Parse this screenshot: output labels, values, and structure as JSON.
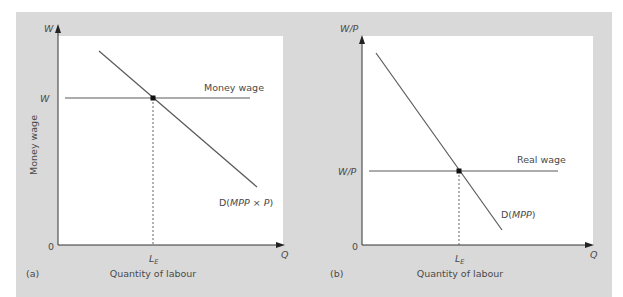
{
  "colors": {
    "background": "#d9d9d9",
    "plot_area": "#ffffff",
    "line": "#5a5a5a",
    "axis": "#333333",
    "point": "#111111",
    "text": "#4a4a4a"
  },
  "panels": [
    {
      "id": "a",
      "panel_label": "(a)",
      "y_axis_name": "W",
      "y_axis_title": "Money wage",
      "x_axis_name": "Q",
      "x_axis_title": "Quantity of labour",
      "origin_label": "0",
      "y_tick_label": "W",
      "x_tick_label_main": "L",
      "x_tick_label_sub": "E",
      "horizontal_line_label": "Money wage",
      "demand_label_prefix": "D(",
      "demand_label_italic": "MPP",
      "demand_label_mid": " × ",
      "demand_label_italic2": "P",
      "demand_label_suffix": ")"
    },
    {
      "id": "b",
      "panel_label": "(b)",
      "y_axis_name": "W/P",
      "x_axis_name": "Q",
      "x_axis_title": "Quantity of labour",
      "origin_label": "0",
      "y_tick_label": "W/P",
      "x_tick_label_main": "L",
      "x_tick_label_sub": "E",
      "horizontal_line_label": "Real wage",
      "demand_label_prefix": "D(",
      "demand_label_italic": "MPP",
      "demand_label_suffix": ")"
    }
  ]
}
